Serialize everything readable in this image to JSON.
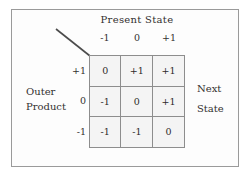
{
  "figure": {
    "column_group_title": "Present State",
    "row_group_label_lines": [
      "Outer",
      "Product"
    ],
    "output_label_lines": [
      "Next",
      "State"
    ],
    "column_headers": [
      "-1",
      "0",
      "+1"
    ],
    "row_headers": [
      "+1",
      "0",
      "-1"
    ],
    "cells": [
      [
        "0",
        "+1",
        "+1"
      ],
      [
        "-1",
        "0",
        "+1"
      ],
      [
        "-1",
        "-1",
        "0"
      ]
    ],
    "colors": {
      "frame_border": "#9a9a9a",
      "table_border": "#5d5d5d",
      "cell_border": "#8d8d8d",
      "cell_fill": "#f4f4f4",
      "text": "#33302f",
      "diagonal_line": "#4c4c4c",
      "background": "#ffffff"
    }
  }
}
